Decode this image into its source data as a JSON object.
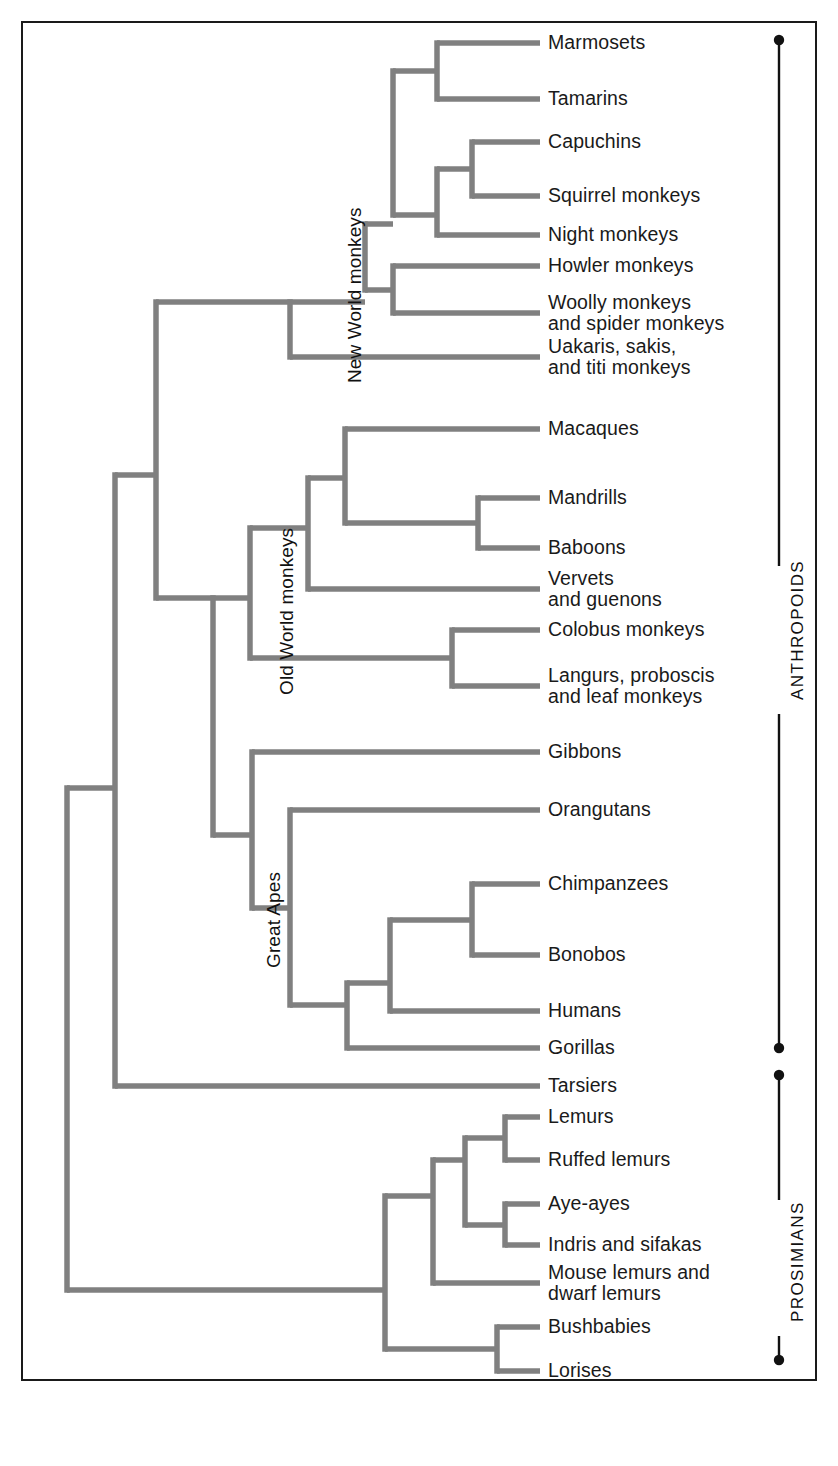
{
  "figure": {
    "type": "phylogenetic-tree",
    "line_color": "#808080",
    "frame_color": "#1a1a1a",
    "text_color": "#1a1a1a",
    "background": "#ffffff"
  },
  "leaves": [
    {
      "id": "marmosets",
      "label": "Marmosets",
      "y": 43
    },
    {
      "id": "tamarins",
      "label": "Tamarins",
      "y": 99
    },
    {
      "id": "capuchins",
      "label": "Capuchins",
      "y": 142
    },
    {
      "id": "squirrel-monkeys",
      "label": "Squirrel monkeys",
      "y": 196
    },
    {
      "id": "night-monkeys",
      "label": "Night monkeys",
      "y": 235
    },
    {
      "id": "howler-monkeys",
      "label": "Howler monkeys",
      "y": 266
    },
    {
      "id": "woolly-monkeys",
      "label": "Woolly monkeys\nand spider monkeys",
      "y": 313
    },
    {
      "id": "uakaris",
      "label": "Uakaris, sakis,\nand titi monkeys",
      "y": 357
    },
    {
      "id": "macaques",
      "label": "Macaques",
      "y": 429
    },
    {
      "id": "mandrills",
      "label": "Mandrills",
      "y": 498
    },
    {
      "id": "baboons",
      "label": "Baboons",
      "y": 548
    },
    {
      "id": "vervets",
      "label": "Vervets\nand guenons",
      "y": 589
    },
    {
      "id": "colobus-monkeys",
      "label": "Colobus monkeys",
      "y": 630
    },
    {
      "id": "langurs",
      "label": "Langurs, proboscis\nand leaf monkeys",
      "y": 686
    },
    {
      "id": "gibbons",
      "label": "Gibbons",
      "y": 752
    },
    {
      "id": "orangutans",
      "label": "Orangutans",
      "y": 810
    },
    {
      "id": "chimpanzees",
      "label": "Chimpanzees",
      "y": 884
    },
    {
      "id": "bonobos",
      "label": "Bonobos",
      "y": 955
    },
    {
      "id": "humans",
      "label": "Humans",
      "y": 1011
    },
    {
      "id": "gorillas",
      "label": "Gorillas",
      "y": 1048
    },
    {
      "id": "tarsiers",
      "label": "Tarsiers",
      "y": 1086
    },
    {
      "id": "lemurs",
      "label": "Lemurs",
      "y": 1117
    },
    {
      "id": "ruffed-lemurs",
      "label": "Ruffed lemurs",
      "y": 1160
    },
    {
      "id": "aye-ayes",
      "label": "Aye-ayes",
      "y": 1204
    },
    {
      "id": "indris-sifakas",
      "label": "Indris and sifakas",
      "y": 1245
    },
    {
      "id": "mouse-lemurs",
      "label": "Mouse lemurs and\ndwarf lemurs",
      "y": 1283
    },
    {
      "id": "bushbabies",
      "label": "Bushbabies",
      "y": 1327
    },
    {
      "id": "lorises",
      "label": "Lorises",
      "y": 1371
    }
  ],
  "clade_labels": [
    {
      "id": "new-world-monkeys",
      "label": "New World monkeys",
      "x": 344,
      "y": 383
    },
    {
      "id": "old-world-monkeys",
      "label": "Old World monkeys",
      "x": 276,
      "y": 695
    },
    {
      "id": "great-apes",
      "label": "Great Apes",
      "x": 263,
      "y": 968
    }
  ],
  "brackets": [
    {
      "id": "anthropoids",
      "label": "ANTHROPOIDS",
      "top": 40,
      "bottom": 1048,
      "label_y": 640
    },
    {
      "id": "prosimians",
      "label": "PROSIMIANS",
      "top": 1075,
      "bottom": 1360,
      "label_y": 1268
    }
  ],
  "tree_edges": {
    "note": "Rectangular cladogram. Horizontal leaf lines all terminate at x=540. Internal vertical connectors at fixed x depths.",
    "leaf_tip_x": 540,
    "label_x": 548,
    "nodes": [
      {
        "id": "root",
        "x": 67,
        "children_y": [
          788,
          1290
        ]
      },
      {
        "id": "haplorhini",
        "x": 115,
        "children_y": [
          475,
          1086
        ]
      },
      {
        "id": "anthropoid-split",
        "x": 156,
        "children_y": [
          302,
          598
        ]
      },
      {
        "id": "catarrhine",
        "x": 213,
        "children_y": [
          598,
          835
        ]
      },
      {
        "id": "nwm-root",
        "x": 290,
        "children_y": [
          302,
          357
        ]
      },
      {
        "id": "nwm-a",
        "x": 365,
        "children_y": [
          224,
          290
        ]
      },
      {
        "id": "nwm-cebidae",
        "x": 393,
        "children_y": [
          142,
          290
        ]
      },
      {
        "id": "callitrichid",
        "x": 437,
        "children_y": [
          43,
          99
        ]
      },
      {
        "id": "cebinae",
        "x": 437,
        "children_y": [
          169,
          235
        ]
      },
      {
        "id": "cap-squirrel",
        "x": 472,
        "children_y": [
          142,
          196
        ]
      },
      {
        "id": "atelid",
        "x": 393,
        "children_y": [
          266,
          313
        ]
      },
      {
        "id": "owm-root",
        "x": 250,
        "children_y": [
          528,
          658
        ]
      },
      {
        "id": "cercopithecine",
        "x": 308,
        "children_y": [
          478,
          589
        ]
      },
      {
        "id": "macaque-papio",
        "x": 345,
        "children_y": [
          429,
          523
        ]
      },
      {
        "id": "mandrill-baboon",
        "x": 478,
        "children_y": [
          498,
          548
        ]
      },
      {
        "id": "colobine",
        "x": 308,
        "children_y": [
          658,
          658
        ]
      },
      {
        "id": "colobine-split",
        "x": 452,
        "children_y": [
          630,
          686
        ]
      },
      {
        "id": "hominoid",
        "x": 252,
        "children_y": [
          752,
          908
        ]
      },
      {
        "id": "great-apes-node",
        "x": 290,
        "children_y": [
          810,
          1005
        ]
      },
      {
        "id": "african-apes",
        "x": 347,
        "children_y": [
          983,
          1048
        ]
      },
      {
        "id": "homininae",
        "x": 390,
        "children_y": [
          920,
          1011
        ]
      },
      {
        "id": "pan",
        "x": 472,
        "children_y": [
          884,
          955
        ]
      },
      {
        "id": "strepsirrhine",
        "x": 385,
        "children_y": [
          1196,
          1349
        ]
      },
      {
        "id": "lemuriform",
        "x": 433,
        "children_y": [
          1160,
          1283
        ]
      },
      {
        "id": "lemur-group",
        "x": 465,
        "children_y": [
          1138,
          1225
        ]
      },
      {
        "id": "lemur-pair",
        "x": 505,
        "children_y": [
          1117,
          1160
        ]
      },
      {
        "id": "indri-pair",
        "x": 505,
        "children_y": [
          1204,
          1245
        ]
      },
      {
        "id": "lorisiform",
        "x": 497,
        "children_y": [
          1327,
          1371
        ]
      }
    ]
  }
}
